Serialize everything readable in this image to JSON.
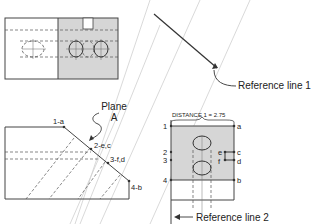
{
  "diagram": {
    "top_view": {
      "shaded_color": "#d6d6d6"
    },
    "reference_line_1": {
      "label": "Reference line 1"
    },
    "reference_line_2": {
      "label": "Reference line 2"
    },
    "plane": {
      "label_line1": "Plane",
      "label_line2": "A"
    },
    "edge_view_points": [
      {
        "label": "1-a"
      },
      {
        "label": "2-e,c"
      },
      {
        "label": "3-f,d"
      },
      {
        "label": "4-b"
      }
    ],
    "front_view": {
      "distance_label": "DISTANCE 1 = 2.75",
      "left_points": [
        "1",
        "2",
        "3",
        "4"
      ],
      "right_points": [
        "a",
        "e",
        "c",
        "f",
        "d",
        "b"
      ]
    },
    "colors": {
      "line": "#444444",
      "shade": "#d6d6d6",
      "projection": "#c8c8c8"
    }
  }
}
